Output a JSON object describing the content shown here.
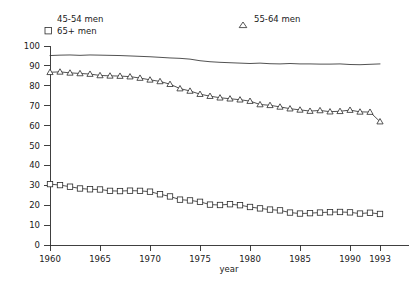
{
  "chart_data": {
    "type": "line",
    "title": "",
    "xlabel": "year",
    "ylabel": "",
    "xlim": [
      1960,
      1993
    ],
    "ylim": [
      0,
      100
    ],
    "grid": false,
    "legend_position": "top",
    "xticks": [
      1960,
      1965,
      1970,
      1975,
      1980,
      1985,
      1990,
      1993
    ],
    "xtick_labels": [
      "1960",
      "1965",
      "1970",
      "1975",
      "1980",
      "1985",
      "1990",
      "1993"
    ],
    "yticks": [
      0,
      10,
      20,
      30,
      40,
      50,
      60,
      70,
      80,
      90,
      100
    ],
    "ytick_labels": [
      "0",
      "10",
      "20",
      "30",
      "40",
      "50",
      "60",
      "70",
      "80",
      "90",
      "100"
    ],
    "x": [
      1960,
      1961,
      1962,
      1963,
      1964,
      1965,
      1966,
      1967,
      1968,
      1969,
      1970,
      1971,
      1972,
      1973,
      1974,
      1975,
      1976,
      1977,
      1978,
      1979,
      1980,
      1981,
      1982,
      1983,
      1984,
      1985,
      1986,
      1987,
      1988,
      1989,
      1990,
      1991,
      1992,
      1993
    ],
    "series": [
      {
        "name": "45-54 men",
        "marker": "none",
        "values": [
          95.2,
          95.4,
          95.5,
          95.3,
          95.5,
          95.4,
          95.3,
          95.2,
          95.0,
          94.8,
          94.6,
          94.3,
          94.0,
          93.8,
          93.4,
          92.6,
          92.1,
          91.8,
          91.6,
          91.4,
          91.2,
          91.4,
          91.1,
          91.0,
          91.2,
          91.0,
          91.0,
          90.9,
          90.9,
          91.0,
          90.7,
          90.6,
          90.8,
          91.0
        ]
      },
      {
        "name": "55-64 men",
        "marker": "triangle",
        "values": [
          86.8,
          87.0,
          86.5,
          86.2,
          85.9,
          85.2,
          85.0,
          84.9,
          84.6,
          83.9,
          83.0,
          82.2,
          80.8,
          78.6,
          77.4,
          75.8,
          74.8,
          74.0,
          73.5,
          73.0,
          72.3,
          70.6,
          70.2,
          69.4,
          68.5,
          67.9,
          67.3,
          67.6,
          67.0,
          67.2,
          67.8,
          66.9,
          66.8,
          62.0
        ]
      },
      {
        "name": "65+ men",
        "marker": "square",
        "values": [
          30.6,
          30.1,
          29.3,
          28.4,
          28.0,
          27.9,
          27.2,
          27.1,
          27.3,
          27.2,
          26.8,
          25.5,
          24.4,
          22.8,
          22.4,
          21.7,
          20.3,
          20.1,
          20.5,
          20.0,
          19.1,
          18.4,
          17.8,
          17.4,
          16.3,
          15.8,
          16.0,
          16.3,
          16.5,
          16.6,
          16.4,
          15.8,
          16.2,
          15.6
        ]
      }
    ],
    "legend": [
      {
        "label": "45-54 men",
        "marker": "none"
      },
      {
        "label": "55-64 men",
        "marker": "triangle"
      },
      {
        "label": "65+ men",
        "marker": "square"
      }
    ]
  }
}
